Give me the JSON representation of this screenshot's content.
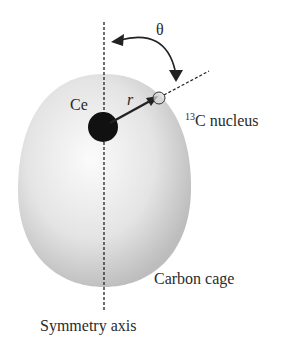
{
  "diagram": {
    "labels": {
      "ce": "Ce",
      "radius": "r",
      "theta": "θ",
      "nucleus_mass_number": "13",
      "nucleus_text": "C nucleus",
      "cage": "Carbon cage",
      "axis": "Symmetry axis"
    },
    "colors": {
      "cage_light": "#f7f7f7",
      "cage_dark": "#b8b8b8",
      "ce_atom": "#111111",
      "lines": "#222222"
    }
  }
}
